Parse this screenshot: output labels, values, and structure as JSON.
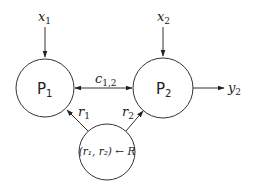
{
  "diagram": {
    "nodes": [
      {
        "id": "P1",
        "label": "P",
        "subscript": "1"
      },
      {
        "id": "P2",
        "label": "P",
        "subscript": "2"
      },
      {
        "id": "R",
        "label": "(r₁, r₂) ← R"
      }
    ],
    "inputs": [
      {
        "label": "x",
        "subscript": "1",
        "target": "P1"
      },
      {
        "label": "x",
        "subscript": "2",
        "target": "P2"
      }
    ],
    "outputs": [
      {
        "label": "y",
        "subscript": "2",
        "source": "P2"
      }
    ],
    "edges": [
      {
        "from": "P1",
        "to": "P2",
        "bidirectional": true,
        "label": "c",
        "subscript": "1,2"
      },
      {
        "from": "R",
        "to": "P1",
        "label": "r",
        "subscript": "1"
      },
      {
        "from": "R",
        "to": "P2",
        "label": "r",
        "subscript": "2"
      }
    ]
  }
}
